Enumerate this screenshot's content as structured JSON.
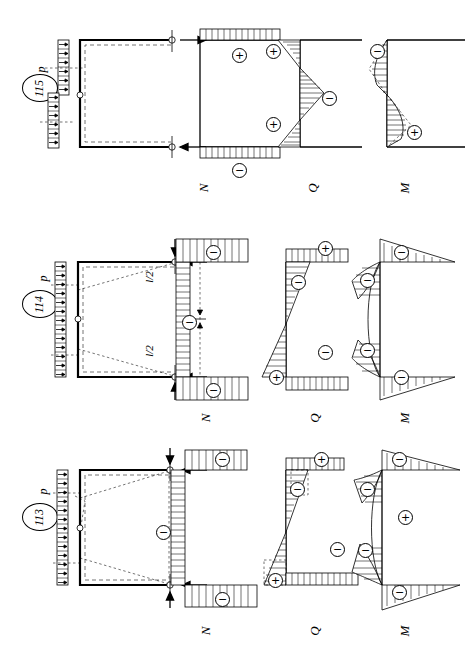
{
  "figure": {
    "orientation": "rotated-90",
    "background": "#ffffff",
    "ink": "#000000"
  },
  "diagram_labels": {
    "normal_force": "N",
    "shear_force": "Q",
    "bending_moment": "M",
    "load": "p",
    "span_half": "l/2",
    "plus_sign": "+",
    "minus_sign": "−"
  },
  "cases": [
    {
      "number": "115",
      "load_label": "p",
      "diagrams": [
        {
          "kind": "N",
          "label": "N",
          "signs": [
            {
              "sign": "+",
              "location": "top-field"
            },
            {
              "sign": "−",
              "location": "bottom-field"
            }
          ]
        },
        {
          "kind": "Q",
          "label": "Q",
          "signs": [
            {
              "sign": "+",
              "location": "top-left"
            },
            {
              "sign": "−",
              "location": "middle-right"
            },
            {
              "sign": "+",
              "location": "bottom-left"
            }
          ]
        },
        {
          "kind": "M",
          "label": "M",
          "signs": [
            {
              "sign": "−",
              "location": "top-left"
            },
            {
              "sign": "+",
              "location": "bottom-right"
            }
          ]
        }
      ]
    },
    {
      "number": "114",
      "load_label": "p",
      "dimensions": [
        "l/2",
        "l/2"
      ],
      "diagrams": [
        {
          "kind": "N",
          "label": "N",
          "signs": [
            {
              "sign": "−",
              "location": "top-flange"
            },
            {
              "sign": "−",
              "location": "web"
            },
            {
              "sign": "−",
              "location": "bottom-flange"
            }
          ]
        },
        {
          "kind": "Q",
          "label": "Q",
          "signs": [
            {
              "sign": "+",
              "location": "top-outer"
            },
            {
              "sign": "−",
              "location": "top-inner"
            },
            {
              "sign": "−",
              "location": "bottom-inner"
            },
            {
              "sign": "+",
              "location": "bottom-outer"
            }
          ]
        },
        {
          "kind": "M",
          "label": "M",
          "signs": [
            {
              "sign": "−",
              "location": "top-beam"
            },
            {
              "sign": "−",
              "location": "upper-column"
            },
            {
              "sign": "−",
              "location": "lower-column"
            },
            {
              "sign": "−",
              "location": "bottom-beam"
            }
          ]
        }
      ]
    },
    {
      "number": "113",
      "load_label": "p",
      "diagrams": [
        {
          "kind": "N",
          "label": "N",
          "signs": [
            {
              "sign": "−",
              "location": "top-flange"
            },
            {
              "sign": "−",
              "location": "web"
            },
            {
              "sign": "−",
              "location": "bottom-flange"
            }
          ]
        },
        {
          "kind": "Q",
          "label": "Q",
          "signs": [
            {
              "sign": "+",
              "location": "top-outer"
            },
            {
              "sign": "−",
              "location": "top-inner"
            },
            {
              "sign": "−",
              "location": "bottom-inner"
            },
            {
              "sign": "+",
              "location": "bottom-outer"
            }
          ]
        },
        {
          "kind": "M",
          "label": "M",
          "signs": [
            {
              "sign": "−",
              "location": "top-beam"
            },
            {
              "sign": "−",
              "location": "upper-column"
            },
            {
              "sign": "+",
              "location": "mid-column"
            },
            {
              "sign": "−",
              "location": "lower-column"
            },
            {
              "sign": "−",
              "location": "bottom-beam"
            }
          ]
        }
      ]
    }
  ]
}
